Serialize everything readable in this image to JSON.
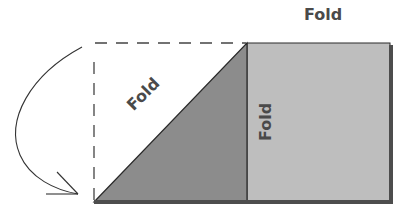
{
  "diagram": {
    "title": "Fold",
    "labels": {
      "top": "Fold",
      "diagonal": "Fold",
      "vertical": "Fold"
    },
    "colors": {
      "triangle_fill": "#8c8c8c",
      "rectangle_fill": "#bebebe",
      "edge_dark": "#4d4d4d",
      "outline": "#2a2a2a",
      "dashed_line": "#444444",
      "text": "#4a4a4a"
    },
    "elements": [
      "dashed-outline-square",
      "folded-triangle",
      "paper-rectangle",
      "curved-fold-arrow"
    ]
  }
}
